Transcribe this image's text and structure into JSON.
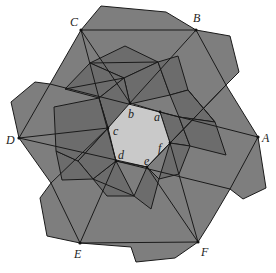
{
  "figure": {
    "title": "",
    "colors": {
      "background": "#ffffff",
      "tile_dark": "#6e6e6e",
      "tile_mid": "#7c7c7c",
      "tile_light": "#878787",
      "center_hexagon": "#c9c9c9",
      "edge": "#1a1a1a"
    },
    "outer_labels": [
      {
        "id": "A",
        "text": "A",
        "x": 262,
        "y": 142
      },
      {
        "id": "B",
        "text": "B",
        "x": 193,
        "y": 22
      },
      {
        "id": "C",
        "text": "C",
        "x": 70,
        "y": 26
      },
      {
        "id": "D",
        "text": "D",
        "x": 6,
        "y": 144
      },
      {
        "id": "E",
        "text": "E",
        "x": 74,
        "y": 258
      },
      {
        "id": "F",
        "text": "F",
        "x": 201,
        "y": 256
      }
    ],
    "inner_labels": [
      {
        "id": "a",
        "text": "a",
        "x": 154,
        "y": 121
      },
      {
        "id": "b",
        "text": "b",
        "x": 128,
        "y": 118
      },
      {
        "id": "c",
        "text": "c",
        "x": 113,
        "y": 135
      },
      {
        "id": "d",
        "text": "d",
        "x": 118,
        "y": 159
      },
      {
        "id": "e",
        "text": "e",
        "x": 144,
        "y": 165
      },
      {
        "id": "f",
        "text": "f",
        "x": 158,
        "y": 152
      }
    ]
  }
}
